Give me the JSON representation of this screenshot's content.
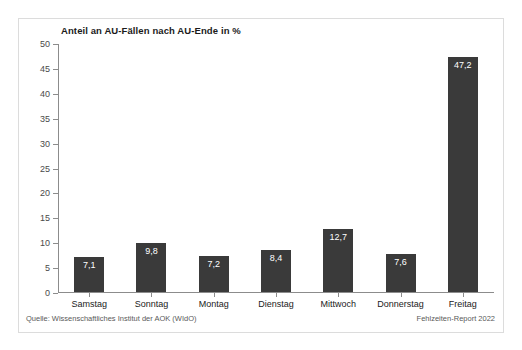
{
  "chart_data": {
    "type": "bar",
    "title": "Anteil an AU-Fällen nach AU-Ende in %",
    "xlabel": "",
    "ylabel": "",
    "categories": [
      "Samstag",
      "Sonntag",
      "Montag",
      "Dienstag",
      "Mittwoch",
      "Donnerstag",
      "Freitag"
    ],
    "values": [
      7.1,
      9.8,
      7.2,
      8.4,
      12.7,
      7.6,
      47.2
    ],
    "value_labels": [
      "7,1",
      "9,8",
      "7,2",
      "8,4",
      "12,7",
      "7,6",
      "47,2"
    ],
    "ylim": [
      0,
      50
    ],
    "yticks": [
      0,
      5,
      10,
      15,
      20,
      25,
      30,
      35,
      40,
      45,
      50
    ],
    "ytick_labels": [
      "0",
      "5",
      "10",
      "15",
      "20",
      "25",
      "30",
      "35",
      "40",
      "45",
      "50"
    ],
    "grid": false,
    "legend": false,
    "bar_color": "#3a3a3a",
    "value_label_color": "#ffffff",
    "axis_color": "#8c8c8c"
  },
  "footer": {
    "source": "Quelle: Wissenschaftliches Institut der AOK (WIdO)",
    "report": "Fehlzeiten-Report 2022"
  }
}
